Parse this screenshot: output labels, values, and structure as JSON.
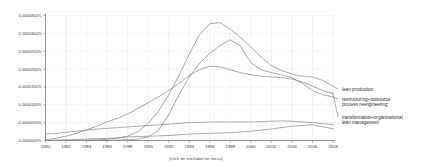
{
  "chart_data": {
    "type": "line",
    "title": "",
    "xlabel": "(click on line/label for focus)",
    "ylabel": "",
    "xlim": [
      1980,
      2008
    ],
    "ylim": [
      0.0,
      3.5e-05
    ],
    "grid": true,
    "legend_position": "right",
    "x_ticks": [
      "1980",
      "1982",
      "1984",
      "1986",
      "1988",
      "1990",
      "1992",
      "1994",
      "1996",
      "1998",
      "2000",
      "2002",
      "2004",
      "2006",
      "2008"
    ],
    "y_ticks": [
      "0.0000350%",
      "0.0000300%",
      "0.0000250%",
      "0.0000200%",
      "0.0000150%",
      "0.0000100%",
      "0.0000050%",
      "0.0000000%"
    ],
    "x": [
      1980,
      1981,
      1982,
      1983,
      1984,
      1985,
      1986,
      1987,
      1988,
      1989,
      1990,
      1991,
      1992,
      1993,
      1994,
      1995,
      1996,
      1997,
      1998,
      1999,
      2000,
      2001,
      2002,
      2003,
      2004,
      2005,
      2006,
      2007,
      2008
    ],
    "series": [
      {
        "name": "lean production",
        "color": "#8c8c8c",
        "values": [
          0.0,
          0.0,
          0.0,
          0.0,
          1e-07,
          2e-07,
          3e-07,
          6e-07,
          1.2e-06,
          2.5e-06,
          4.8e-06,
          8.2e-06,
          1.28e-05,
          1.82e-05,
          2.42e-05,
          2.96e-05,
          3.27e-05,
          3.3e-05,
          3.12e-05,
          2.88e-05,
          2.62e-05,
          2.34e-05,
          2.1e-05,
          1.96e-05,
          1.86e-05,
          1.8e-05,
          1.78e-05,
          1.68e-05,
          1.52e-05
        ]
      },
      {
        "name": "restructuring+outsource process reengineering",
        "color": "#8c8c8c",
        "values": [
          0.0,
          0.0,
          0.0,
          0.0,
          0.0,
          0.0,
          0.0,
          1e-07,
          2e-07,
          4e-07,
          1e-06,
          2.8e-06,
          7.2e-06,
          1.28e-05,
          1.78e-05,
          2.16e-05,
          2.44e-05,
          2.66e-05,
          2.82e-05,
          2.64e-05,
          2.18e-05,
          1.98e-05,
          1.9e-05,
          1.84e-05,
          1.76e-05,
          1.6e-05,
          1.4e-05,
          1.28e-05,
          1.22e-05
        ]
      },
      {
        "name": "transformation+organizational",
        "color": "#8c8c8c",
        "values": [
          2e-07,
          6e-07,
          1.2e-06,
          2e-06,
          3e-06,
          4e-06,
          5.2e-06,
          6.2e-06,
          7.4e-06,
          9e-06,
          1.06e-05,
          1.22e-05,
          1.4e-05,
          1.6e-05,
          1.82e-05,
          1.98e-05,
          2.08e-05,
          2.06e-05,
          1.98e-05,
          1.9e-05,
          1.84e-05,
          1.8e-05,
          1.78e-05,
          1.76e-05,
          1.72e-05,
          1.64e-05,
          1.52e-05,
          1.4e-05,
          1.32e-05
        ]
      },
      {
        "name": "lean management",
        "color": "#8c8c8c",
        "values": [
          1.8e-06,
          2e-06,
          2.3e-06,
          2.6e-06,
          2.9e-06,
          3.2e-06,
          3.4e-06,
          3.6e-06,
          3.8e-06,
          4e-06,
          4.2e-06,
          4.4e-06,
          4.6e-06,
          4.8e-06,
          5e-06,
          5.1e-06,
          5.2e-06,
          5.2e-06,
          5.2e-06,
          5.2e-06,
          5.2e-06,
          5.3e-06,
          5.4e-06,
          5.5e-06,
          5.4e-06,
          5.2e-06,
          5e-06,
          4.7e-06,
          4.5e-06
        ]
      },
      {
        "name": "baseline-series",
        "color": "#8c8c8c",
        "values": [
          0.0,
          1e-07,
          2e-07,
          3e-07,
          4e-07,
          5e-07,
          6e-07,
          8e-07,
          1e-06,
          1.1e-06,
          1.2e-06,
          1.3e-06,
          1.4e-06,
          1.6e-06,
          1.8e-06,
          1.9e-06,
          2e-06,
          2.1e-06,
          2.2e-06,
          2.4e-06,
          2.6e-06,
          2.9e-06,
          3.2e-06,
          3.6e-06,
          4e-06,
          4.2e-06,
          4.4e-06,
          3.8e-06,
          3.3e-06
        ]
      }
    ],
    "legend_entries": [
      {
        "label_line1": "lean production",
        "label_line2": ""
      },
      {
        "label_line1": "restructuring+outsource",
        "label_line2": "process reengineering"
      },
      {
        "label_line1": "transformation+organizational",
        "label_line2": "lean management"
      }
    ]
  }
}
